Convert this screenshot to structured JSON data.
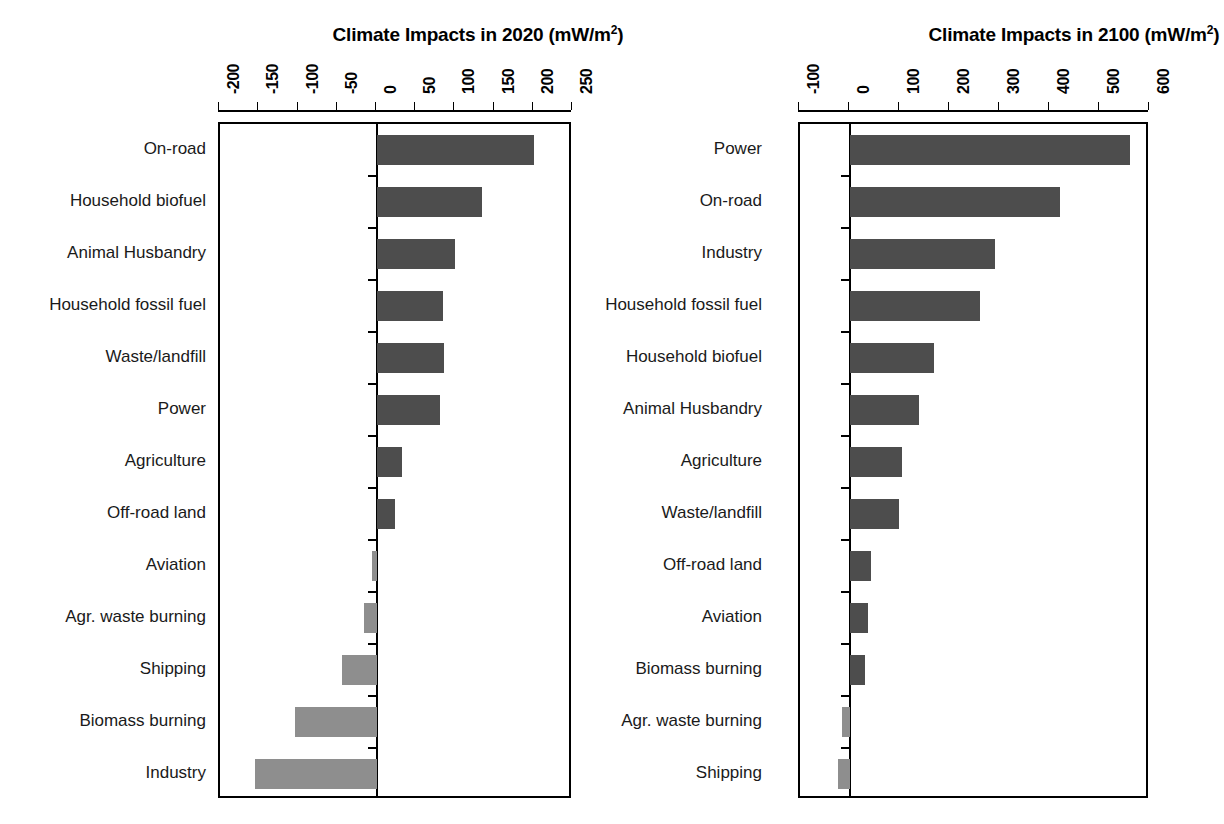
{
  "figure": {
    "background": "#ffffff",
    "bar_color_positive": "#4d4d4d",
    "bar_color_negative": "#8e8e8e"
  },
  "panels": {
    "left": {
      "title_main": "Climate Impacts in 2020 (mW/m",
      "title_sup": "2",
      "title_tail": ")",
      "title_full": "Climate Impacts in 2020 (mW/m2)"
    },
    "right": {
      "title_main": "Climate Impacts in 2100 (mW/m",
      "title_sup": "2",
      "title_tail": ")",
      "title_full": "Climate Impacts in 2100 (mW/m2)"
    }
  },
  "chart_data": [
    {
      "type": "bar",
      "orientation": "horizontal",
      "title": "Climate Impacts in 2020 (mW/m2)",
      "xlabel": "",
      "ylabel": "",
      "xlim": [
        -200,
        250
      ],
      "xticks": [
        -200,
        -150,
        -100,
        -50,
        0,
        50,
        100,
        150,
        200,
        250
      ],
      "xtick_labels": [
        "-200",
        "-150",
        "-100",
        "-50",
        "0",
        "50",
        "100",
        "150",
        "200",
        "250"
      ],
      "grid": false,
      "legend": "none",
      "categories": [
        "On-road",
        "Household biofuel",
        "Animal Husbandry",
        "Household fossil fuel",
        "Waste/landfill",
        "Power",
        "Agriculture",
        "Off-road land",
        "Aviation",
        "Agr. waste burning",
        "Shipping",
        "Biomass burning",
        "Industry"
      ],
      "values": [
        200,
        134,
        100,
        84,
        85,
        80,
        32,
        23,
        -6,
        -16,
        -44,
        -105,
        -156
      ]
    },
    {
      "type": "bar",
      "orientation": "horizontal",
      "title": "Climate Impacts in 2100 (mW/m2)",
      "xlabel": "",
      "ylabel": "",
      "xlim": [
        -100,
        600
      ],
      "xticks": [
        -100,
        0,
        100,
        200,
        300,
        400,
        500,
        600
      ],
      "xtick_labels": [
        "-100",
        "0",
        "100",
        "200",
        "300",
        "400",
        "500",
        "600"
      ],
      "grid": false,
      "legend": "none",
      "categories": [
        "Power",
        "On-road",
        "Industry",
        "Household fossil fuel",
        "Household biofuel",
        "Animal Husbandry",
        "Agriculture",
        "Waste/landfill",
        "Off-road land",
        "Aviation",
        "Biomass burning",
        "Agr. waste burning",
        "Shipping"
      ],
      "values": [
        560,
        420,
        290,
        260,
        168,
        138,
        104,
        98,
        42,
        36,
        30,
        -16,
        -24
      ]
    }
  ]
}
